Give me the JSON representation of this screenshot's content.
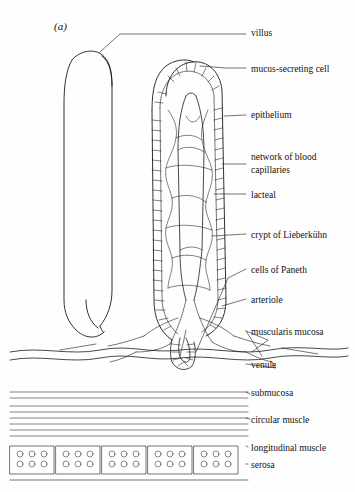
{
  "figure": {
    "panel_label": "(a)",
    "labels": [
      {
        "text": "villus",
        "x": 251,
        "y": 34
      },
      {
        "text": "mucus-secreting cell",
        "x": 251,
        "y": 71
      },
      {
        "text": "epithelium",
        "x": 251,
        "y": 117
      },
      {
        "text": "network of blood",
        "x": 251,
        "y": 159
      },
      {
        "text": "capillaries",
        "x": 251,
        "y": 171
      },
      {
        "text": "lacteal",
        "x": 251,
        "y": 196
      },
      {
        "text": "crypt of Lieberkühn",
        "x": 251,
        "y": 236
      },
      {
        "text": "cells of Paneth",
        "x": 251,
        "y": 271
      },
      {
        "text": "arteriole",
        "x": 251,
        "y": 301
      },
      {
        "text": "muscularis mucosa",
        "x": 251,
        "y": 333
      },
      {
        "text": "venule",
        "x": 251,
        "y": 366
      },
      {
        "text": "submucosa",
        "x": 251,
        "y": 394
      },
      {
        "text": "circular muscle",
        "x": 251,
        "y": 421
      },
      {
        "text": "longitudinal muscle",
        "x": 251,
        "y": 449
      },
      {
        "text": "serosa",
        "x": 251,
        "y": 466
      }
    ],
    "colors": {
      "ink": "#1a1a1a",
      "background": "#ffffff"
    },
    "caption_alt": "Histological section diagram of the small intestine wall showing a villus, crypt of Lieberkühn, and the layers of the gut wall"
  }
}
